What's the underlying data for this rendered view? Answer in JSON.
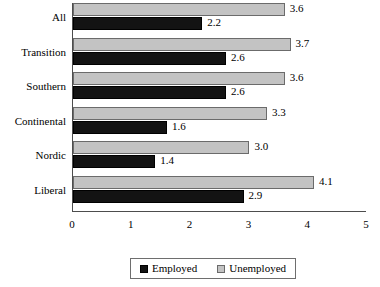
{
  "chart_data": {
    "type": "bar",
    "orientation": "horizontal",
    "title": "",
    "xlabel": "",
    "ylabel": "",
    "xlim": [
      0,
      5
    ],
    "xticks": [
      "0",
      "1",
      "2",
      "3",
      "4",
      "5"
    ],
    "grid": false,
    "legend_position": "bottom",
    "categories": [
      "All",
      "Transition",
      "Southern",
      "Continental",
      "Nordic",
      "Liberal"
    ],
    "series": [
      {
        "name": "Employed",
        "color": "#131313",
        "values": [
          2.2,
          2.6,
          2.6,
          1.6,
          1.4,
          2.9
        ],
        "labels": [
          "2.2",
          "2.6",
          "2.6",
          "1.6",
          "1.4",
          "2.9"
        ]
      },
      {
        "name": "Unemployed",
        "color": "#c3c3c3",
        "values": [
          3.6,
          3.7,
          3.6,
          3.3,
          3.0,
          4.1
        ],
        "labels": [
          "3.6",
          "3.7",
          "3.6",
          "3.3",
          "3.0",
          "4.1"
        ]
      }
    ]
  },
  "legend": {
    "items": [
      {
        "label": "Employed",
        "swatch": "employed-swatch"
      },
      {
        "label": "Unemployed",
        "swatch": "unemployed-swatch"
      }
    ]
  }
}
